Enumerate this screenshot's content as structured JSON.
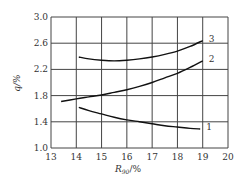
{
  "chart_data": {
    "type": "line",
    "title": "",
    "xlabel": "R90/%",
    "xlabel_main": "R",
    "xlabel_sub": "90",
    "xlabel_suffix": "/%",
    "ylabel": "q/%",
    "xlim": [
      13,
      20
    ],
    "ylim": [
      1.0,
      3.0
    ],
    "grid": true,
    "x_ticks": [
      13,
      14,
      15,
      16,
      17,
      18,
      19,
      20
    ],
    "x_tick_labels": [
      "13",
      "14",
      "15",
      "16",
      "17",
      "18",
      "19",
      "20"
    ],
    "y_ticks": [
      1.0,
      1.4,
      1.8,
      2.2,
      2.6,
      3.0
    ],
    "y_tick_labels": [
      "1.0",
      "1.4",
      "1.8",
      "2.2",
      "2.6",
      "3.0"
    ],
    "series": [
      {
        "name": "1",
        "label": "1",
        "x": [
          14.1,
          14.5,
          15.0,
          15.5,
          16.0,
          16.5,
          17.0,
          17.5,
          18.0,
          18.5,
          18.9
        ],
        "y": [
          1.62,
          1.57,
          1.52,
          1.47,
          1.43,
          1.4,
          1.37,
          1.34,
          1.32,
          1.3,
          1.29
        ]
      },
      {
        "name": "2",
        "label": "2",
        "x": [
          13.4,
          14.0,
          14.5,
          15.0,
          15.5,
          16.0,
          16.5,
          17.0,
          17.5,
          18.0,
          18.5,
          19.0
        ],
        "y": [
          1.71,
          1.75,
          1.78,
          1.81,
          1.85,
          1.89,
          1.94,
          2.0,
          2.07,
          2.14,
          2.23,
          2.33
        ]
      },
      {
        "name": "3",
        "label": "3",
        "x": [
          14.1,
          14.5,
          15.0,
          15.5,
          16.0,
          16.5,
          17.0,
          17.5,
          18.0,
          18.5,
          19.0
        ],
        "y": [
          2.39,
          2.36,
          2.34,
          2.33,
          2.34,
          2.36,
          2.39,
          2.43,
          2.48,
          2.55,
          2.64
        ]
      }
    ]
  }
}
